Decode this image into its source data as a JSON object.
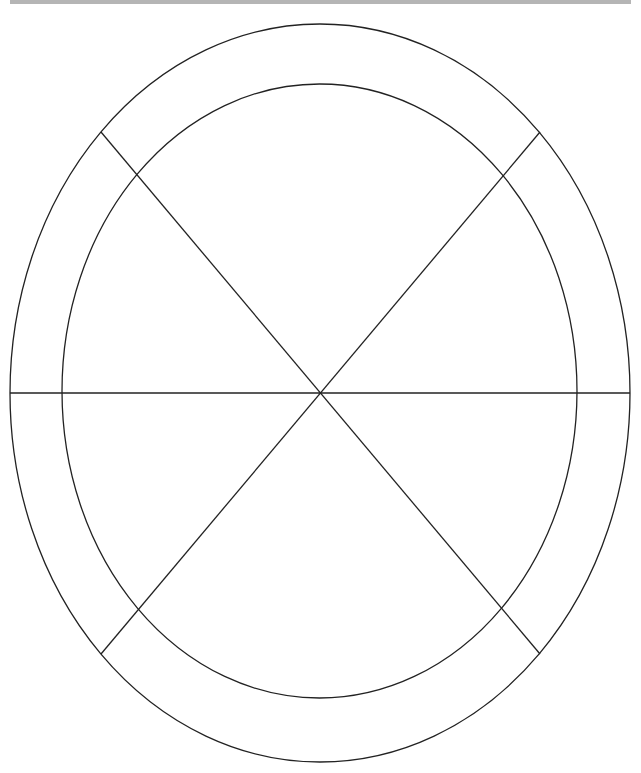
{
  "canvas": {
    "width": 641,
    "height": 773,
    "background": "#ffffff"
  },
  "top_bar": {
    "color": "#b5b5b5"
  },
  "diagram": {
    "stroke_color": "#222222",
    "stroke_width": 1.3,
    "center": {
      "x": 320,
      "y": 393
    },
    "outer_ellipse": {
      "cx": 320,
      "cy": 393,
      "rx": 310,
      "ry": 369
    },
    "inner_ellipse": {
      "cx": 319.5,
      "cy": 391,
      "rx": 257.5,
      "ry": 307
    },
    "lines": [
      {
        "name": "horizontal-divider",
        "x1": 10,
        "y1": 393,
        "x2": 630,
        "y2": 393
      },
      {
        "name": "diagonal-divider-descending",
        "x1": 101,
        "y1": 132,
        "x2": 540,
        "y2": 654
      },
      {
        "name": "diagonal-divider-ascending",
        "x1": 540,
        "y1": 132,
        "x2": 101,
        "y2": 654
      }
    ],
    "segments": 6
  }
}
